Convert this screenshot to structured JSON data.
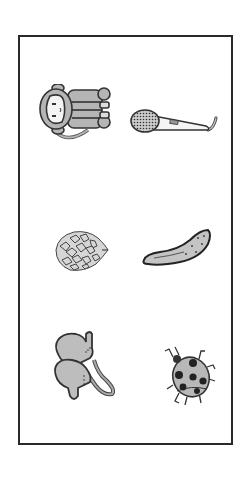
{
  "worksheet": {
    "layout": "3 rows x 2 columns picture grid inside a bordered frame",
    "colors": {
      "border": "#2a2a2a",
      "fill": "#b5b5b5",
      "outline": "#333333",
      "background": "#ffffff"
    },
    "items": [
      {
        "label": "monkey",
        "row": 1,
        "col": 1
      },
      {
        "label": "microphone",
        "row": 1,
        "col": 2
      },
      {
        "label": "pine cone",
        "row": 2,
        "col": 1
      },
      {
        "label": "cucumber",
        "row": 2,
        "col": 2
      },
      {
        "label": "mittens",
        "row": 3,
        "col": 1
      },
      {
        "label": "ladybug",
        "row": 3,
        "col": 2
      }
    ]
  }
}
